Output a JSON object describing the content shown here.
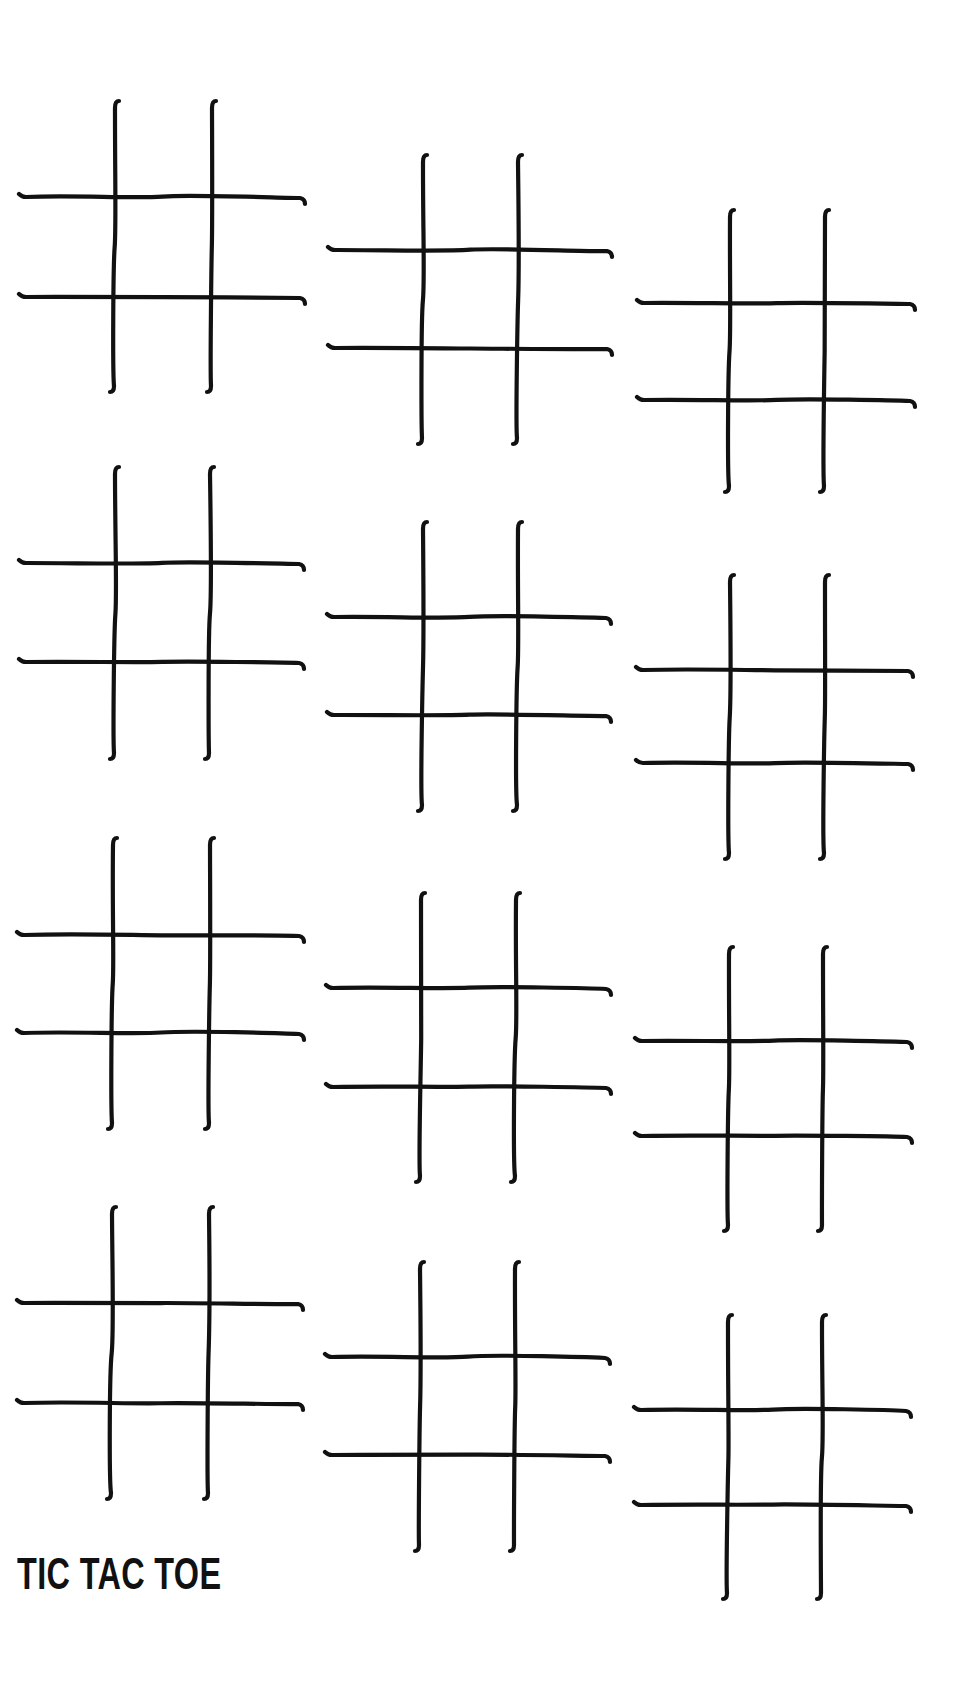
{
  "page": {
    "title": "TIC TAC TOE",
    "background_color": "#ffffff",
    "ink_color": "#111111"
  },
  "boards": [
    {
      "id": 1,
      "row": 1,
      "col": 1,
      "v": [
        115,
        212
      ],
      "h": [
        197,
        297
      ],
      "top": 101,
      "bottom": 393,
      "left": 19,
      "right": 306
    },
    {
      "id": 2,
      "row": 1,
      "col": 2,
      "v": [
        423,
        518
      ],
      "h": [
        250,
        348
      ],
      "top": 155,
      "bottom": 445,
      "left": 328,
      "right": 613
    },
    {
      "id": 3,
      "row": 1,
      "col": 3,
      "v": [
        730,
        825
      ],
      "h": [
        303,
        400
      ],
      "top": 210,
      "bottom": 493,
      "left": 637,
      "right": 916
    },
    {
      "id": 4,
      "row": 2,
      "col": 1,
      "v": [
        115,
        210
      ],
      "h": [
        563,
        662
      ],
      "top": 467,
      "bottom": 760,
      "left": 19,
      "right": 305
    },
    {
      "id": 5,
      "row": 2,
      "col": 2,
      "v": [
        423,
        518
      ],
      "h": [
        617,
        715
      ],
      "top": 522,
      "bottom": 812,
      "left": 327,
      "right": 612
    },
    {
      "id": 6,
      "row": 2,
      "col": 3,
      "v": [
        730,
        825
      ],
      "h": [
        670,
        763
      ],
      "top": 575,
      "bottom": 860,
      "left": 636,
      "right": 914
    },
    {
      "id": 7,
      "row": 3,
      "col": 1,
      "v": [
        113,
        210
      ],
      "h": [
        935,
        1033
      ],
      "top": 838,
      "bottom": 1130,
      "left": 17,
      "right": 305
    },
    {
      "id": 8,
      "row": 3,
      "col": 2,
      "v": [
        421,
        516
      ],
      "h": [
        988,
        1087
      ],
      "top": 893,
      "bottom": 1183,
      "left": 326,
      "right": 612
    },
    {
      "id": 9,
      "row": 3,
      "col": 3,
      "v": [
        729,
        823
      ],
      "h": [
        1041,
        1136
      ],
      "top": 947,
      "bottom": 1232,
      "left": 635,
      "right": 913
    },
    {
      "id": 10,
      "row": 4,
      "col": 1,
      "v": [
        112,
        209
      ],
      "h": [
        1303,
        1403
      ],
      "top": 1207,
      "bottom": 1500,
      "left": 17,
      "right": 304
    },
    {
      "id": 11,
      "row": 4,
      "col": 2,
      "v": [
        420,
        515
      ],
      "h": [
        1357,
        1455
      ],
      "top": 1262,
      "bottom": 1552,
      "left": 325,
      "right": 611
    },
    {
      "id": 12,
      "row": 4,
      "col": 3,
      "v": [
        728,
        822
      ],
      "h": [
        1410,
        1505
      ],
      "top": 1315,
      "bottom": 1600,
      "left": 634,
      "right": 912
    }
  ]
}
